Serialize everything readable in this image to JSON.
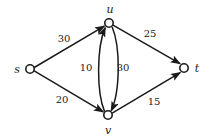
{
  "figure": {
    "type": "flow-network-diagram",
    "background_color": "#ffffff",
    "stroke_color": "#1a1a1a",
    "node_fill_color": "#ffffff"
  },
  "nodes": [
    {
      "id": "s",
      "label": "s",
      "cx": 30,
      "cy": 69,
      "r": 4.2,
      "label_x": 17,
      "label_y": 69
    },
    {
      "id": "u",
      "label": "u",
      "cx": 109,
      "cy": 23,
      "r": 4.2,
      "label_x": 110,
      "label_y": 9
    },
    {
      "id": "v",
      "label": "v",
      "cx": 108,
      "cy": 115,
      "r": 4.2,
      "label_x": 108,
      "label_y": 130
    },
    {
      "id": "t",
      "label": "t",
      "cx": 184,
      "cy": 68,
      "r": 4.2,
      "label_x": 197,
      "label_y": 68
    }
  ],
  "edges": [
    {
      "id": "s-u",
      "from": "s",
      "to": "u",
      "capacity": "30",
      "label_x": 64,
      "label_y": 39,
      "shape": "straight"
    },
    {
      "id": "s-v",
      "from": "s",
      "to": "v",
      "capacity": "20",
      "label_x": 62,
      "label_y": 100,
      "shape": "straight"
    },
    {
      "id": "u-t",
      "from": "u",
      "to": "t",
      "capacity": "25",
      "label_x": 150,
      "label_y": 34,
      "shape": "straight"
    },
    {
      "id": "v-t",
      "from": "v",
      "to": "t",
      "capacity": "15",
      "label_x": 154,
      "label_y": 102,
      "shape": "straight"
    },
    {
      "id": "v-u",
      "from": "v",
      "to": "u",
      "capacity": "10",
      "label_x": 86,
      "label_y": 68,
      "shape": "curve-left"
    },
    {
      "id": "u-v",
      "from": "u",
      "to": "v",
      "capacity": "30",
      "label_x": 123,
      "label_y": 68,
      "shape": "curve-right"
    }
  ]
}
